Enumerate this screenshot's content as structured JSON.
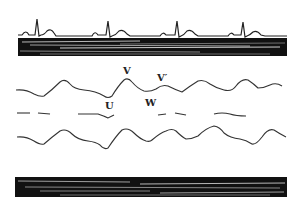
{
  "figure": {
    "type": "physiological waveform diagram",
    "traces": [
      {
        "name": "ECG",
        "beats": 4
      },
      {
        "name": "timing band top"
      },
      {
        "name": "waveform 1 (with labeled peaks)"
      },
      {
        "name": "waveform 2 (dashed baseline)"
      },
      {
        "name": "waveform 3"
      },
      {
        "name": "timing band bottom"
      }
    ],
    "labels": {
      "v": "V",
      "v_prime": "V′",
      "u": "U",
      "w": "W"
    },
    "colors": {
      "ink": "#222222",
      "background": "#ffffff"
    }
  }
}
